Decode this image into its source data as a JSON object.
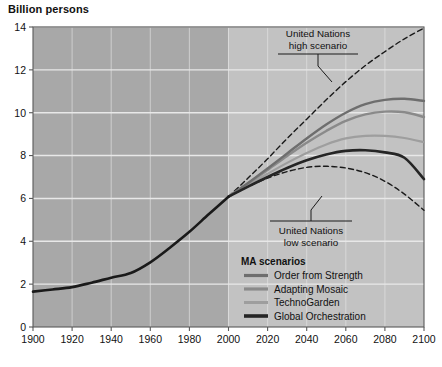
{
  "chart_data": {
    "type": "line",
    "title": "",
    "ylabel": "Billion persons",
    "xlabel": "",
    "xlim": [
      1900,
      2100
    ],
    "ylim": [
      0,
      14
    ],
    "xticks": [
      "1900",
      "1920",
      "1940",
      "1960",
      "1980",
      "2000",
      "2020",
      "2040",
      "2060",
      "2080",
      "2100"
    ],
    "yticks": [
      "0",
      "2",
      "4",
      "6",
      "8",
      "10",
      "12",
      "14"
    ],
    "grid": "horizontal",
    "legend_position": "inside-bottom-right",
    "historical_split_year": 2000,
    "annotations": [
      {
        "name": "un-high",
        "line1": "United Nations",
        "line2": "high scenario"
      },
      {
        "name": "un-low",
        "line1": "United Nations",
        "line2": "low scenario"
      }
    ],
    "legend_title": "MA scenarios",
    "x": [
      1900,
      1910,
      1920,
      1930,
      1940,
      1950,
      1960,
      1970,
      1980,
      1990,
      2000,
      2010,
      2020,
      2030,
      2040,
      2050,
      2060,
      2070,
      2080,
      2090,
      2100
    ],
    "series": [
      {
        "name": "Historical",
        "color": "#1a1a1a",
        "width": 2.6,
        "style": "solid",
        "values": [
          1.65,
          1.75,
          1.86,
          2.07,
          2.3,
          2.52,
          3.02,
          3.7,
          4.44,
          5.27,
          6.08,
          null,
          null,
          null,
          null,
          null,
          null,
          null,
          null,
          null,
          null
        ]
      },
      {
        "name": "United Nations high scenario",
        "color": "#1a1a1a",
        "width": 1.4,
        "style": "dashed",
        "values": [
          null,
          null,
          null,
          null,
          null,
          null,
          null,
          null,
          null,
          null,
          6.08,
          6.95,
          7.85,
          8.8,
          9.7,
          10.6,
          11.45,
          12.2,
          12.85,
          13.45,
          13.95
        ]
      },
      {
        "name": "United Nations low scenario",
        "color": "#1a1a1a",
        "width": 1.4,
        "style": "dashed",
        "values": [
          null,
          null,
          null,
          null,
          null,
          null,
          null,
          null,
          null,
          null,
          6.08,
          6.55,
          6.95,
          7.25,
          7.45,
          7.5,
          7.42,
          7.2,
          6.8,
          6.2,
          5.45
        ]
      },
      {
        "name": "Order from Strength",
        "color": "#6e6e6e",
        "width": 2.4,
        "style": "solid",
        "values": [
          null,
          null,
          null,
          null,
          null,
          null,
          null,
          null,
          null,
          null,
          6.08,
          6.72,
          7.4,
          8.1,
          8.8,
          9.45,
          10.0,
          10.4,
          10.6,
          10.65,
          10.55
        ]
      },
      {
        "name": "Adapting Mosaic",
        "color": "#8a8a8a",
        "width": 2.4,
        "style": "solid",
        "values": [
          null,
          null,
          null,
          null,
          null,
          null,
          null,
          null,
          null,
          null,
          6.08,
          6.7,
          7.33,
          7.98,
          8.6,
          9.15,
          9.62,
          9.92,
          10.05,
          10.02,
          9.8
        ]
      },
      {
        "name": "TechnoGarden",
        "color": "#9e9e9e",
        "width": 2.2,
        "style": "solid",
        "values": [
          null,
          null,
          null,
          null,
          null,
          null,
          null,
          null,
          null,
          null,
          6.08,
          6.62,
          7.15,
          7.66,
          8.12,
          8.52,
          8.8,
          8.92,
          8.92,
          8.82,
          8.62
        ]
      },
      {
        "name": "Global Orchestration",
        "color": "#252525",
        "width": 2.6,
        "style": "solid",
        "values": [
          null,
          null,
          null,
          null,
          null,
          null,
          null,
          null,
          null,
          null,
          6.08,
          6.55,
          7.0,
          7.42,
          7.78,
          8.05,
          8.22,
          8.25,
          8.15,
          7.9,
          6.9
        ]
      }
    ],
    "legend_entries": [
      {
        "label": "Order from Strength",
        "color": "#6e6e6e",
        "width": 3.2
      },
      {
        "label": "Adapting Mosaic",
        "color": "#8a8a8a",
        "width": 3.2
      },
      {
        "label": "TechnoGarden",
        "color": "#9e9e9e",
        "width": 3.0
      },
      {
        "label": "Global Orchestration",
        "color": "#252525",
        "width": 3.6
      }
    ],
    "colors": {
      "plot_background_past": "#a8a8a8",
      "plot_background_future": "#c2c2c2",
      "gridline": "#e8e8e8",
      "axis": "#5a5a5a",
      "text": "#111111"
    }
  }
}
